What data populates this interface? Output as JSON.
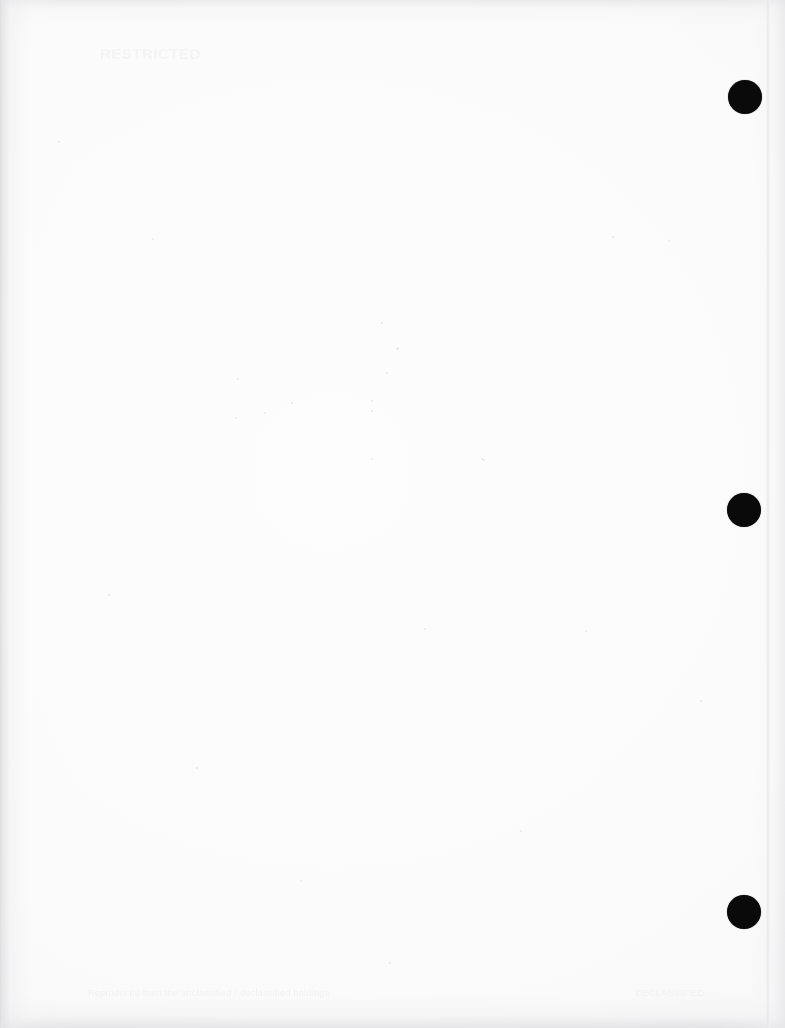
{
  "page": {
    "kind": "scanned-blank-document-page",
    "width": 785,
    "height": 1028,
    "background_color": "#fdfdfd",
    "paper_tone_color": "#f7f7f8",
    "edge_shadow_color": "#e4e4e6"
  },
  "header": {
    "ghost_text": "RESTRICTED"
  },
  "footer": {
    "ghost_text": "Reproduced from the unclassified / declassified holdings",
    "ghost_text_right": "DECLASSIFIED"
  },
  "marks": {
    "color": "#0a0a0a",
    "punches": [
      {
        "label": "punch-mark-top",
        "cx": 745,
        "cy": 97,
        "d": 34
      },
      {
        "label": "punch-mark-middle",
        "cx": 744,
        "cy": 510,
        "d": 34
      },
      {
        "label": "punch-mark-bottom",
        "cx": 744,
        "cy": 912,
        "d": 34
      }
    ]
  },
  "speckles": [
    {
      "x": 237,
      "y": 378,
      "s": 2
    },
    {
      "x": 381,
      "y": 322,
      "s": 2
    },
    {
      "x": 396,
      "y": 347,
      "s": 3
    },
    {
      "x": 386,
      "y": 372,
      "s": 2
    },
    {
      "x": 371,
      "y": 400,
      "s": 2
    },
    {
      "x": 371,
      "y": 410,
      "s": 2
    },
    {
      "x": 291,
      "y": 402,
      "s": 2
    },
    {
      "x": 264,
      "y": 412,
      "s": 2
    },
    {
      "x": 235,
      "y": 417,
      "s": 2
    },
    {
      "x": 371,
      "y": 458,
      "s": 2
    },
    {
      "x": 481,
      "y": 458,
      "s": 2
    },
    {
      "x": 483,
      "y": 459,
      "s": 2
    },
    {
      "x": 152,
      "y": 238,
      "s": 2
    },
    {
      "x": 612,
      "y": 236,
      "s": 2
    },
    {
      "x": 668,
      "y": 240,
      "s": 2
    },
    {
      "x": 424,
      "y": 628,
      "s": 2
    },
    {
      "x": 585,
      "y": 630,
      "s": 2
    },
    {
      "x": 108,
      "y": 594,
      "s": 2
    },
    {
      "x": 196,
      "y": 767,
      "s": 2
    },
    {
      "x": 389,
      "y": 962,
      "s": 2
    },
    {
      "x": 58,
      "y": 141,
      "s": 2
    },
    {
      "x": 700,
      "y": 700,
      "s": 2
    },
    {
      "x": 520,
      "y": 830,
      "s": 2
    },
    {
      "x": 300,
      "y": 880,
      "s": 2
    }
  ]
}
